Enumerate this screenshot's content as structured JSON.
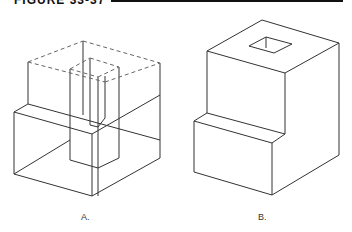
{
  "figure": {
    "title": "FIGURE 33-37"
  },
  "panels": [
    {
      "label": "A.",
      "style": "wireframe with hidden lines",
      "solid_lines": [
        [
          [
            14,
            112
          ],
          [
            92,
            134
          ]
        ],
        [
          [
            14,
            112
          ],
          [
            14,
            174
          ]
        ],
        [
          [
            14,
            174
          ],
          [
            92,
            196
          ]
        ],
        [
          [
            92,
            134
          ],
          [
            92,
            196
          ]
        ],
        [
          [
            92,
            196
          ],
          [
            160,
            158
          ]
        ],
        [
          [
            160,
            63
          ],
          [
            160,
            158
          ]
        ],
        [
          [
            28,
            62
          ],
          [
            28,
            104
          ]
        ],
        [
          [
            14,
            112
          ],
          [
            28,
            104
          ]
        ],
        [
          [
            28,
            104
          ],
          [
            160,
            140
          ]
        ],
        [
          [
            83,
            41
          ],
          [
            83,
            115
          ]
        ],
        [
          [
            70,
            69
          ],
          [
            70,
            160
          ]
        ],
        [
          [
            119,
            67
          ],
          [
            119,
            158
          ]
        ],
        [
          [
            70,
            160
          ],
          [
            98,
            168
          ]
        ],
        [
          [
            98,
            168
          ],
          [
            119,
            158
          ]
        ],
        [
          [
            90,
            58
          ],
          [
            90,
            125
          ]
        ],
        [
          [
            98,
            77
          ],
          [
            98,
            196
          ]
        ],
        [
          [
            105,
            76
          ],
          [
            105,
            118
          ]
        ],
        [
          [
            90,
            125
          ],
          [
            98,
            127
          ]
        ],
        [
          [
            98,
            127
          ],
          [
            105,
            118
          ]
        ],
        [
          [
            14,
            174
          ],
          [
            70,
            140
          ]
        ],
        [
          [
            92,
            134
          ],
          [
            160,
            95
          ]
        ]
      ],
      "dashed_lines": [
        [
          [
            28,
            62
          ],
          [
            83,
            41
          ]
        ],
        [
          [
            83,
            41
          ],
          [
            160,
            63
          ]
        ],
        [
          [
            28,
            62
          ],
          [
            105,
            82
          ]
        ],
        [
          [
            105,
            82
          ],
          [
            160,
            63
          ]
        ],
        [
          [
            70,
            69
          ],
          [
            90,
            58
          ]
        ],
        [
          [
            90,
            58
          ],
          [
            119,
            67
          ]
        ],
        [
          [
            70,
            69
          ],
          [
            98,
            77
          ]
        ],
        [
          [
            98,
            77
          ],
          [
            119,
            67
          ]
        ]
      ]
    },
    {
      "label": "B.",
      "style": "solid object with square hole",
      "solid_lines": [
        [
          [
            207,
            51
          ],
          [
            262,
            20
          ]
        ],
        [
          [
            262,
            20
          ],
          [
            339,
            43
          ]
        ],
        [
          [
            207,
            51
          ],
          [
            285,
            73
          ]
        ],
        [
          [
            285,
            73
          ],
          [
            339,
            43
          ]
        ],
        [
          [
            207,
            51
          ],
          [
            207,
            113
          ]
        ],
        [
          [
            285,
            73
          ],
          [
            285,
            134
          ]
        ],
        [
          [
            339,
            43
          ],
          [
            339,
            155
          ]
        ],
        [
          [
            207,
            113
          ],
          [
            285,
            134
          ]
        ],
        [
          [
            207,
            113
          ],
          [
            194,
            121
          ]
        ],
        [
          [
            285,
            134
          ],
          [
            272,
            143
          ]
        ],
        [
          [
            194,
            121
          ],
          [
            272,
            143
          ]
        ],
        [
          [
            194,
            121
          ],
          [
            194,
            172
          ]
        ],
        [
          [
            272,
            143
          ],
          [
            272,
            195
          ]
        ],
        [
          [
            194,
            172
          ],
          [
            272,
            195
          ]
        ],
        [
          [
            272,
            195
          ],
          [
            339,
            155
          ]
        ],
        [
          [
            249,
            46
          ],
          [
            266,
            37
          ]
        ],
        [
          [
            266,
            37
          ],
          [
            292,
            44
          ]
        ],
        [
          [
            249,
            46
          ],
          [
            274,
            53
          ]
        ],
        [
          [
            274,
            53
          ],
          [
            292,
            44
          ]
        ],
        [
          [
            266,
            37
          ],
          [
            266,
            48
          ]
        ]
      ]
    }
  ],
  "colors": {
    "line": "#333333",
    "dashed": "#666666",
    "title_rule": "#111111"
  }
}
